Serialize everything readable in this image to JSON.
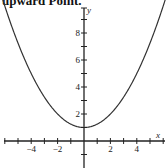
{
  "caption": "upward Point.",
  "chart_data": {
    "type": "line",
    "title": "",
    "xlabel": "x",
    "ylabel": "y",
    "function": "y = x^2/4 + 1",
    "series": [
      {
        "name": "parabola",
        "x": [
          -6,
          -5,
          -4,
          -3,
          -2,
          -1,
          0,
          1,
          2,
          3,
          4,
          5,
          6
        ],
        "values": [
          10,
          7.25,
          5,
          3.25,
          2,
          1.25,
          1,
          1.25,
          2,
          3.25,
          5,
          7.25,
          10
        ]
      }
    ],
    "vertex": [
      0,
      1
    ],
    "xlim": [
      -6,
      6
    ],
    "ylim": [
      -2,
      10
    ],
    "x_ticks": [
      -6,
      -5,
      -4,
      -3,
      -2,
      -1,
      1,
      2,
      3,
      4,
      5,
      6
    ],
    "x_tick_labels": [
      "-4",
      "-2",
      "2",
      "4"
    ],
    "y_ticks": [
      -1,
      1,
      2,
      3,
      4,
      5,
      6,
      7,
      8,
      9
    ],
    "y_tick_labels": [
      "2",
      "4",
      "6",
      "8"
    ],
    "grid": false,
    "legend": null
  }
}
